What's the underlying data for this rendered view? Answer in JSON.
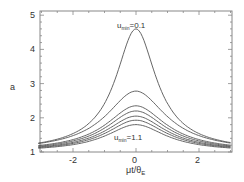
{
  "chart_data": {
    "type": "line",
    "title": "",
    "xlabel": "μt/θE",
    "ylabel": "a",
    "xlim": [
      -3.1,
      3.0
    ],
    "ylim": [
      1,
      5.1
    ],
    "xticks": [
      "-2",
      "0",
      "2"
    ],
    "yticks": [
      "1",
      "2",
      "3",
      "4",
      "5"
    ],
    "grid": false,
    "annotations": [
      {
        "text": "u_min=0.1",
        "x": 0,
        "y": 4.75
      },
      {
        "text": "u_min=1.1",
        "x": 0,
        "y": 1.45
      }
    ],
    "series": [
      {
        "name": "u_min=0.1",
        "peak": 4.6
      },
      {
        "name": "u_min=0.3",
        "peak": 2.78
      },
      {
        "name": "u_min=0.5",
        "peak": 2.35
      },
      {
        "name": "u_min=0.7",
        "peak": 2.2
      },
      {
        "name": "u_min=0.9",
        "peak": 2.05
      },
      {
        "name": "u_min=1.0",
        "peak": 1.93
      },
      {
        "name": "u_min=1.1",
        "peak": 1.8
      }
    ],
    "tail_value_at_edges": 1.1
  },
  "labels": {
    "ylabel": "a",
    "xlabel_main": "μt/θ",
    "xlabel_sub": "E",
    "top_u": "u",
    "top_sub": "min",
    "top_val": "=0.1",
    "bot_u": "u",
    "bot_sub": "min",
    "bot_val": "=1.1",
    "x_ticks": [
      "-2",
      "0",
      "2"
    ],
    "y_ticks": [
      "1",
      "2",
      "3",
      "4",
      "5"
    ]
  }
}
